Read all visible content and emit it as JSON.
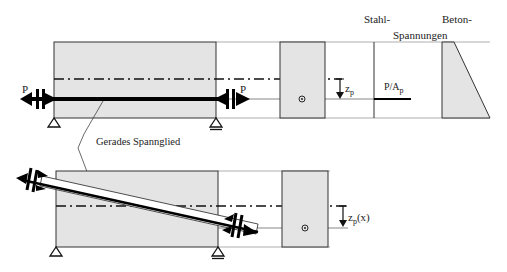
{
  "labels": {
    "force_left": "P",
    "force_right": "P",
    "zp": "z",
    "zp_sub": "p",
    "zpx": "z",
    "zpx_sub": "p",
    "zpx_arg": "(x)",
    "steel_stress": "P/A",
    "steel_stress_sub": "p",
    "steel_header": "Stahl-",
    "concrete_header": "Beton-",
    "stresses_header": "Spannungen",
    "tendon_label": "Gerades Spannglied"
  },
  "colors": {
    "concrete_fill": "#e4e4e4",
    "outline": "#333333",
    "tendon": "#000000"
  }
}
